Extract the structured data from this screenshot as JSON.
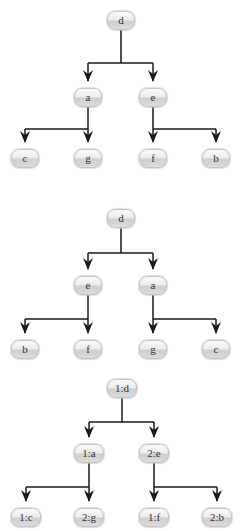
{
  "colors": {
    "edge": "#1a1a1a",
    "node_border": "#c4c4c4",
    "node_top": "#fafafa",
    "node_bottom": "#cfcfcf",
    "label": "#333333"
  },
  "trees": [
    {
      "name": "tree-1",
      "root": "d",
      "level1": [
        "a",
        "e"
      ],
      "level2": [
        "c",
        "g",
        "f",
        "b"
      ],
      "edges": [
        [
          "d",
          "a"
        ],
        [
          "d",
          "e"
        ],
        [
          "a",
          "c"
        ],
        [
          "a",
          "g"
        ],
        [
          "e",
          "f"
        ],
        [
          "e",
          "b"
        ]
      ]
    },
    {
      "name": "tree-2",
      "root": "d",
      "level1": [
        "e",
        "a"
      ],
      "level2": [
        "b",
        "f",
        "g",
        "c"
      ],
      "edges": [
        [
          "d",
          "e"
        ],
        [
          "d",
          "a"
        ],
        [
          "e",
          "b"
        ],
        [
          "e",
          "f"
        ],
        [
          "a",
          "g"
        ],
        [
          "a",
          "c"
        ]
      ]
    },
    {
      "name": "tree-3",
      "root": "1:d",
      "level1": [
        "1:a",
        "2:e"
      ],
      "level2": [
        "1:c",
        "2:g",
        "1:f",
        "2:b"
      ],
      "edges": [
        [
          "1:d",
          "1:a"
        ],
        [
          "1:d",
          "2:e"
        ],
        [
          "1:a",
          "1:c"
        ],
        [
          "1:a",
          "2:g"
        ],
        [
          "2:e",
          "1:f"
        ],
        [
          "2:e",
          "2:b"
        ]
      ]
    }
  ]
}
